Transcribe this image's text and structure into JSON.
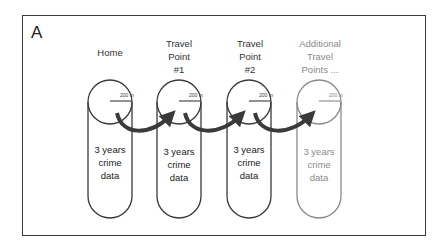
{
  "panel": {
    "label": "A"
  },
  "columns": [
    {
      "title_lines": [
        "Home"
      ],
      "radius_label": "200 m",
      "body_lines": [
        "3 years",
        "crime",
        "data"
      ],
      "faded": false
    },
    {
      "title_lines": [
        "Travel",
        "Point",
        "#1"
      ],
      "radius_label": "200 m",
      "body_lines": [
        "3 years",
        "crime",
        "data"
      ],
      "faded": false
    },
    {
      "title_lines": [
        "Travel",
        "Point",
        "#2"
      ],
      "radius_label": "200 m",
      "body_lines": [
        "3 years",
        "crime",
        "data"
      ],
      "faded": false
    },
    {
      "title_lines": [
        "Additional",
        "Travel",
        "Points ..."
      ],
      "radius_label": "200 m",
      "body_lines": [
        "3 years",
        "crime",
        "data"
      ],
      "faded": true
    }
  ],
  "colors": {
    "line": "#3a3a3a",
    "faded_line": "#8a8a8a",
    "arrow": "#3a3a3a"
  }
}
